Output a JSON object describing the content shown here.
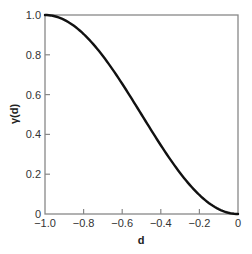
{
  "chart_data": {
    "type": "line",
    "title": "",
    "xlabel": "d",
    "ylabel": "γ(d)",
    "xlim": [
      -1.0,
      0
    ],
    "ylim": [
      0,
      1.0
    ],
    "grid": false,
    "legend": null,
    "x_ticks": [
      -1.0,
      -0.8,
      -0.6,
      -0.4,
      -0.2,
      0
    ],
    "x_tick_labels": [
      "−1.0",
      "−0.8",
      "−0.6",
      "−0.4",
      "−0.2",
      "0"
    ],
    "y_ticks": [
      0,
      0.2,
      0.4,
      0.6,
      0.8,
      1.0
    ],
    "y_tick_labels": [
      "0",
      "0.2",
      "0.4",
      "0.6",
      "0.8",
      "1.0"
    ],
    "series": [
      {
        "name": "γ(d)",
        "color": "#111111",
        "x": [
          -1.0,
          -0.9,
          -0.8,
          -0.7,
          -0.6,
          -0.5,
          -0.4,
          -0.3,
          -0.2,
          -0.1,
          0
        ],
        "values": [
          1.0,
          0.976,
          0.905,
          0.794,
          0.655,
          0.5,
          0.345,
          0.206,
          0.095,
          0.024,
          0
        ]
      }
    ]
  },
  "colors": {
    "curve": "#111111",
    "axes": "#888888",
    "text": "#333333"
  }
}
